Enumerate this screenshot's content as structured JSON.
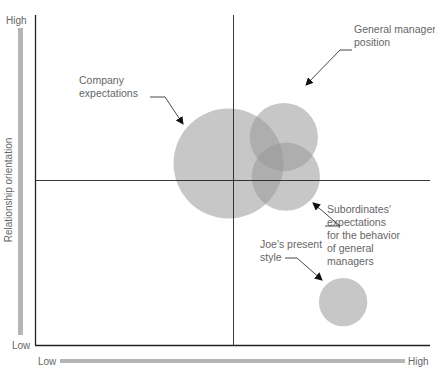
{
  "diagram": {
    "type": "managerial-grid-bubble",
    "y_axis": {
      "label": "Relationship orientation",
      "low": "Low",
      "high": "High"
    },
    "x_axis": {
      "label": "",
      "low": "Low",
      "high": "High"
    },
    "colors": {
      "axis": "#222222",
      "bar": "#b5b5b5",
      "bubble": "#999999",
      "text": "#666666"
    },
    "bubbles": [
      {
        "id": "company",
        "label_lines": [
          "Company",
          "expectations"
        ],
        "x": 0.49,
        "y": 0.55,
        "size": 1.0
      },
      {
        "id": "gm-position",
        "label_lines": [
          "General manager",
          "position"
        ],
        "x": 0.63,
        "y": 0.63,
        "size": 0.62
      },
      {
        "id": "subordinates",
        "label_lines": [
          "Subordinates'",
          "expectations",
          "for the behavior",
          "of general",
          "managers"
        ],
        "x": 0.635,
        "y": 0.51,
        "size": 0.62
      },
      {
        "id": "joe",
        "label_lines": [
          "Joe's present",
          "style"
        ],
        "x": 0.78,
        "y": 0.13,
        "size": 0.44
      }
    ]
  }
}
